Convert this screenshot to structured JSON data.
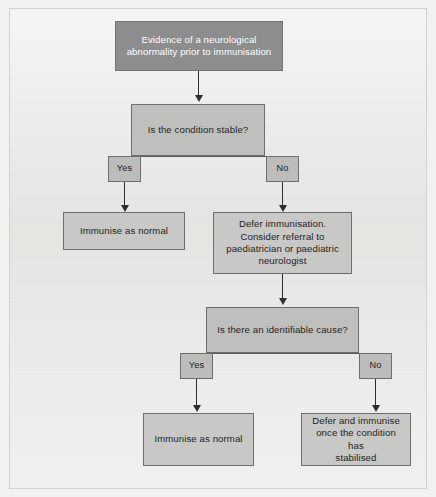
{
  "diagram": {
    "colors": {
      "page_background": "#f1f1ef",
      "paper": "#e9e9e6",
      "node_fill": "#c3c3c1",
      "start_node_fill": "#8d8d8d",
      "start_node_text": "#ffffff",
      "border": "#6e6e6e",
      "connector": "#2e2e2e"
    },
    "nodes": {
      "start": {
        "label": "Evidence of a neurological\nabnormality prior to immunisation",
        "type": "start"
      },
      "decision_stable": {
        "label": "Is the condition stable?",
        "type": "decision"
      },
      "stable_yes": {
        "label": "Yes",
        "type": "branch-label"
      },
      "stable_no": {
        "label": "No",
        "type": "branch-label"
      },
      "immunise_normal_1": {
        "label": "Immunise as normal",
        "type": "outcome"
      },
      "defer_refer": {
        "label": "Defer immunisation.\nConsider referral to\npaediatrician or paediatric\nneurologist",
        "type": "outcome"
      },
      "decision_cause": {
        "label": "Is there an identifiable cause?",
        "type": "decision"
      },
      "cause_yes": {
        "label": "Yes",
        "type": "branch-label"
      },
      "cause_no": {
        "label": "No",
        "type": "branch-label"
      },
      "immunise_normal_2": {
        "label": "Immunise as normal",
        "type": "outcome"
      },
      "defer_stabilised": {
        "label": "Defer and immunise\nonce the condition has\nstabilised",
        "type": "outcome"
      }
    }
  }
}
